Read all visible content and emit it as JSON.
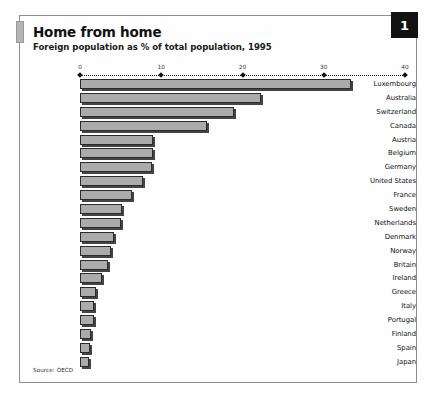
{
  "plate": {
    "number": "1"
  },
  "header": {
    "title": "Home from home",
    "subtitle": "Foreign population as % of total population, 1995"
  },
  "footer": {
    "source": "Source: OECD"
  },
  "chart_data": {
    "type": "bar",
    "orientation": "horizontal",
    "title": "Home from home",
    "subtitle": "Foreign population as % of total population, 1995",
    "xlabel": "",
    "ylabel": "",
    "xlim": [
      0,
      40
    ],
    "xticks": [
      0,
      10,
      20,
      30,
      40
    ],
    "xtick_labels": [
      "0",
      "10",
      "20",
      "30",
      "40"
    ],
    "grid": false,
    "legend": false,
    "axis_position": "top",
    "bar_color": "#ababab",
    "bar_edge_color": "#2b2b2b",
    "categories": [
      "Luxembourg",
      "Australia",
      "Switzerland",
      "Canada",
      "Austria",
      "Belgium",
      "Germany",
      "United States",
      "France",
      "Sweden",
      "Netherlands",
      "Denmark",
      "Norway",
      "Britain",
      "Ireland",
      "Greece",
      "Italy",
      "Portugal",
      "Finland",
      "Spain",
      "Japan"
    ],
    "values": [
      33.4,
      22.3,
      18.9,
      15.6,
      9.0,
      9.0,
      8.8,
      7.8,
      6.4,
      5.2,
      5.1,
      4.2,
      3.8,
      3.4,
      2.7,
      2.0,
      1.7,
      1.7,
      1.3,
      1.2,
      1.1
    ],
    "source": "Source: OECD"
  }
}
